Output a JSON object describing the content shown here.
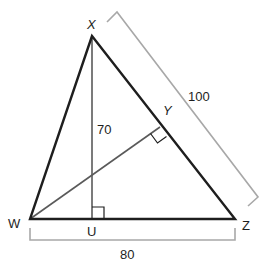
{
  "diagram": {
    "type": "triangle-with-altitudes",
    "vertices": {
      "X": {
        "label": "X",
        "x": 92,
        "y": 36
      },
      "W": {
        "label": "W",
        "x": 30,
        "y": 219
      },
      "Z": {
        "label": "Z",
        "x": 235,
        "y": 219
      },
      "U": {
        "label": "U",
        "x": 92,
        "y": 219
      },
      "Y": {
        "label": "Y",
        "x": 160,
        "y": 127
      }
    },
    "measurements": {
      "XU": {
        "label": "70"
      },
      "XZ": {
        "label": "100"
      },
      "WZ": {
        "label": "80"
      }
    },
    "right_angles": [
      "U",
      "Y"
    ],
    "colors": {
      "triangle": "#1e1e1e",
      "altitude": "#5a5a5a",
      "bracket": "#a8a8a8",
      "text": "#1e1e1e"
    }
  }
}
